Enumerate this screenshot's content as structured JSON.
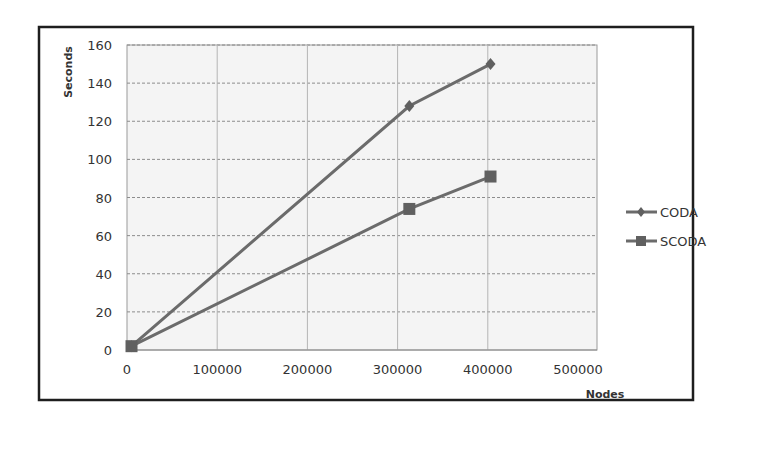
{
  "chart_data": {
    "type": "line",
    "title": "",
    "xlabel": "Nodes",
    "ylabel": "Seconds",
    "xlim": [
      0,
      500000
    ],
    "ylim": [
      0,
      160
    ],
    "xticks": [
      0,
      100000,
      200000,
      300000,
      400000,
      500000
    ],
    "yticks": [
      0,
      20,
      40,
      60,
      80,
      100,
      120,
      140,
      160
    ],
    "xtick_labels": [
      "0",
      "100000",
      "200000",
      "300000",
      "400000",
      "500000"
    ],
    "ytick_labels": [
      "0",
      "20",
      "40",
      "60",
      "80",
      "100",
      "120",
      "140",
      "160"
    ],
    "grid": true,
    "legend_position": "right",
    "series": [
      {
        "name": "CODA",
        "marker": "diamond",
        "color": "#6b6b6b",
        "x": [
          5000,
          313000,
          403000
        ],
        "values": [
          2,
          128,
          150
        ]
      },
      {
        "name": "SCODA",
        "marker": "square",
        "color": "#6b6b6b",
        "x": [
          5000,
          313000,
          403000
        ],
        "values": [
          2,
          74,
          91
        ]
      }
    ]
  },
  "legend": {
    "items": [
      {
        "label": "CODA"
      },
      {
        "label": "SCODA"
      }
    ]
  },
  "axes": {
    "x_title": "Nodes",
    "y_title": "Seconds"
  }
}
